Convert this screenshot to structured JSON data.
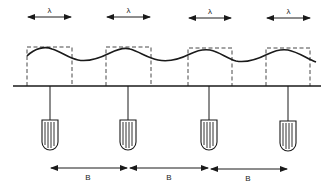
{
  "diagram": {
    "wavelength_label": "λ",
    "spacing_label": "B",
    "units": [
      {
        "box_x": 27,
        "box_w": 45,
        "drop_x": 50
      },
      {
        "box_x": 106,
        "box_w": 45,
        "drop_x": 128
      },
      {
        "box_x": 188,
        "box_w": 44,
        "drop_x": 209
      },
      {
        "box_x": 266,
        "box_w": 44,
        "drop_x": 288
      }
    ],
    "spacing_arrows": [
      {
        "x1": 50,
        "x2": 128,
        "label": "B"
      },
      {
        "x1": 128,
        "x2": 209,
        "label": "B"
      },
      {
        "x1": 209,
        "x2": 288,
        "label": "B"
      }
    ],
    "wavelength_arrows": [
      {
        "x1": 27,
        "x2": 72,
        "label": "λ"
      },
      {
        "x1": 106,
        "x2": 151,
        "label": "λ"
      },
      {
        "x1": 188,
        "x2": 232,
        "label": "λ"
      },
      {
        "x1": 266,
        "x2": 311,
        "label": "λ"
      }
    ],
    "colors": {
      "stroke": "#1a1a1a",
      "background": "#ffffff"
    }
  }
}
